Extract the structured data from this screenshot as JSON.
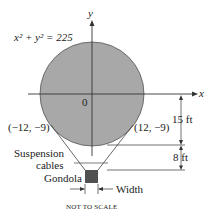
{
  "diagram": {
    "equation": "x² + y² = 225",
    "axis_x_label": "x",
    "axis_y_label": "y",
    "origin_label": "0",
    "point_left": "(−12, −9)",
    "point_right": "(12, −9)",
    "dim_upper": "15 ft",
    "dim_lower": "8 ft",
    "cables_label_line1": "Suspension",
    "cables_label_line2": "cables",
    "gondola_label": "Gondola",
    "width_label": "Width",
    "note": "NOT TO SCALE",
    "colors": {
      "balloon_fill": "#a8a8a8",
      "gondola_fill": "#505050",
      "line": "#333333"
    }
  }
}
